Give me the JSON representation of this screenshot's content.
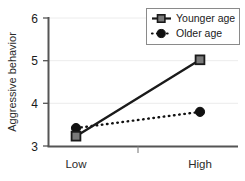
{
  "chart_data": {
    "type": "line",
    "title": "",
    "xlabel": "",
    "ylabel": "Aggressive behavior",
    "categories": [
      "Low",
      "High"
    ],
    "ylim": [
      3,
      6
    ],
    "yticks": [
      3,
      4,
      5,
      6
    ],
    "ytick_labels": [
      "3",
      "4",
      "5",
      "6"
    ],
    "grid": true,
    "legend_position": "top-right",
    "series": [
      {
        "name": "Younger age",
        "values": [
          3.23,
          5.02
        ],
        "marker": "square",
        "linestyle": "solid",
        "color": "#1a1a1a",
        "marker_fill": "#7a7a7a"
      },
      {
        "name": "Older age",
        "values": [
          3.42,
          3.8
        ],
        "marker": "circle",
        "linestyle": "dotted",
        "color": "#111111",
        "marker_fill": "#111111"
      }
    ]
  },
  "axes": {
    "y_axis_label": "Aggressive behavior",
    "y_tick_6": "6",
    "y_tick_5": "5",
    "y_tick_4": "4",
    "y_tick_3": "3",
    "x_cat_low": "Low",
    "x_cat_high": "High"
  },
  "legend": {
    "items": [
      {
        "label": "Younger age"
      },
      {
        "label": "Older age"
      }
    ]
  },
  "colors": {
    "axis": "#555555",
    "grid": "#ececec",
    "younger_line": "#1a1a1a",
    "younger_marker_fill": "#7a7a7a",
    "older_line": "#111111",
    "older_marker_fill": "#111111",
    "background": "#ffffff",
    "text": "#1a1a1a"
  }
}
